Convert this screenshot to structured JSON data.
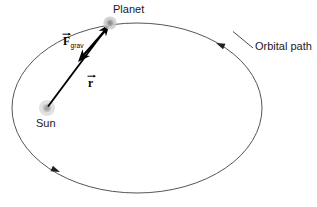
{
  "figure": {
    "title_visible": false,
    "background_color": "#ffffff",
    "stroke_color": "#4d4d4d",
    "vector_color": "#000000",
    "label_color": "#1a1a1a",
    "sun_color": "#9a9a9a",
    "sun_halo_color": "#c9c9c9",
    "planet_color": "#8c8c8c",
    "planet_halo_color": "#bdbdbd"
  },
  "labels": {
    "planet": "Planet",
    "orbital_path": "Orbital path",
    "sun": "Sun",
    "force_vector": "F",
    "force_vector_subscript": "grav",
    "position_vector": "r"
  },
  "diagram_data": {
    "type": "physics-orbit-diagram",
    "description": "Elliptical orbital path with the Sun at one focus and a planet on the orbit; the position vector r points from the Sun to the planet and the gravitational force vector F_grav points from the planet back toward the Sun.",
    "ellipse": {
      "center_x": 137,
      "center_y": 108,
      "radius_x": 125,
      "radius_y": 85,
      "stroke_width": 1
    },
    "bodies": [
      {
        "name": "Sun",
        "x": 47,
        "y": 108,
        "radius": 4.5,
        "halo_radius": 8,
        "role": "focus"
      },
      {
        "name": "Planet",
        "x": 110,
        "y": 23,
        "radius": 4,
        "halo_radius": 6.5,
        "role": "orbiting-body"
      }
    ],
    "vectors": [
      {
        "name": "r",
        "label": "r",
        "from_x": 47,
        "from_y": 108,
        "to_x": 110,
        "to_y": 23,
        "direction": "sun-to-planet",
        "label_x": 88,
        "label_y": 78
      },
      {
        "name": "F_grav",
        "label": "F",
        "subscript": "grav",
        "from_x": 108,
        "from_y": 28,
        "to_x": 78,
        "to_y": 62,
        "direction": "planet-to-sun",
        "label_x": 63,
        "label_y": 36
      }
    ],
    "direction_markers": [
      {
        "name": "upper-right-arrow",
        "x": 216,
        "y": 43,
        "angle_deg": 205,
        "sense": "counterclockwise"
      },
      {
        "name": "lower-left-arrow",
        "x": 60,
        "y": 172,
        "angle_deg": 25,
        "sense": "counterclockwise"
      }
    ],
    "leader_lines": [
      {
        "name": "orbital-path-leader",
        "from_x": 253,
        "from_y": 48,
        "to_x": 232,
        "to_y": 31
      }
    ]
  }
}
